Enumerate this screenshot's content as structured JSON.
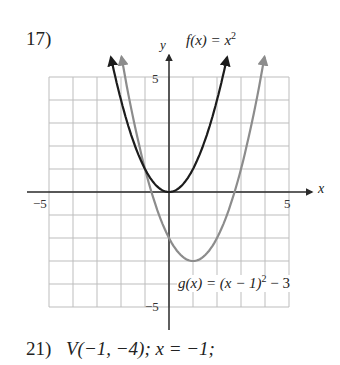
{
  "problem_top": {
    "number": "17)"
  },
  "labels": {
    "y_axis": "y",
    "x_axis": "x",
    "f_name": "f(x) = x",
    "f_exp": "2",
    "g_name_a": "g(x) = (x − 1)",
    "g_exp": "2",
    "g_name_b": " − 3",
    "tick_y_top": "5",
    "tick_y_bottom": "−5",
    "tick_x_left": "−5",
    "tick_x_right": "5"
  },
  "problem_bottom": {
    "number": "21)",
    "text": "V(−1, −4); x = −1;"
  },
  "colors": {
    "f_curve": "#1c1c1c",
    "g_curve": "#8c8c8c",
    "grid": "#bdbdbd",
    "axis": "#2a2a2a"
  },
  "chart_data": {
    "type": "line",
    "title": "",
    "xlabel": "x",
    "ylabel": "y",
    "xlim": [
      -5,
      5
    ],
    "ylim": [
      -5,
      5
    ],
    "grid": true,
    "x_ticks_labeled": [
      -5,
      5
    ],
    "y_ticks_labeled": [
      -5,
      5
    ],
    "series": [
      {
        "name": "f(x) = x^2",
        "color": "#1c1c1c",
        "x": [
          -2.4,
          -2,
          -1,
          0,
          1,
          2,
          2.4
        ],
        "y": [
          5.76,
          4,
          1,
          0,
          1,
          4,
          5.76
        ],
        "vertex": [
          0,
          0
        ]
      },
      {
        "name": "g(x) = (x − 1)^2 − 3",
        "color": "#8c8c8c",
        "x": [
          -2,
          -1,
          0,
          1,
          2,
          3,
          4
        ],
        "y": [
          6,
          1,
          -2,
          -3,
          -2,
          1,
          6
        ],
        "vertex": [
          1,
          -3
        ]
      }
    ],
    "annotations": [
      "f(x) = x^2",
      "g(x) = (x − 1)^2 − 3"
    ]
  }
}
